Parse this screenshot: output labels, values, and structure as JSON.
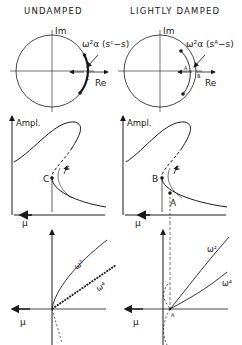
{
  "columns": [
    {
      "title": "UNDAMPED",
      "phase_plot": {
        "axis_im": "Im",
        "axis_re": "Re",
        "formula": "ω²α (sᶜ−s)",
        "point": "C"
      },
      "amplitude_plot": {
        "ylabel": "Ampl.",
        "xlabel": "μ",
        "points": [
          "C"
        ],
        "branch_label": "s"
      },
      "frequency_plot": {
        "xlabel": "μ",
        "curves": [
          "ω²",
          "ω⁴"
        ]
      }
    },
    {
      "title": "LIGHTLY DAMPED",
      "phase_plot": {
        "axis_im": "Im",
        "axis_re": "Re",
        "formula": "ω²α (sᴬ−s)",
        "points": [
          "A",
          "B"
        ]
      },
      "amplitude_plot": {
        "ylabel": "Ampl.",
        "xlabel": "μ",
        "points": [
          "B",
          "A"
        ],
        "branch_label": "s"
      },
      "frequency_plot": {
        "xlabel": "μ",
        "curves": [
          "ω²",
          "ω⁴"
        ],
        "point": "A"
      }
    }
  ]
}
